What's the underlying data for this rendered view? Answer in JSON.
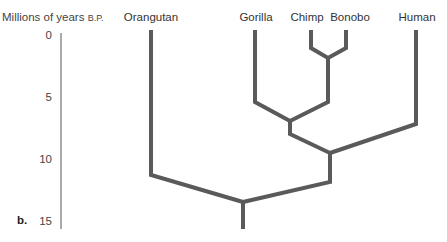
{
  "figure": {
    "panel_label": "b.",
    "axis": {
      "title": "Millions of years",
      "title_suffix": "B.P.",
      "ticks": [
        {
          "label": "0",
          "y": 36
        },
        {
          "label": "5",
          "y": 98
        },
        {
          "label": "10",
          "y": 160
        },
        {
          "label": "15",
          "y": 222
        }
      ],
      "color": "#555555"
    },
    "taxa": [
      {
        "label": "Orangutan",
        "x": 151
      },
      {
        "label": "Gorilla",
        "x": 255
      },
      {
        "label": "Chimp",
        "x": 311
      },
      {
        "label": "Bonobo",
        "x": 346
      },
      {
        "label": "Human",
        "x": 416
      }
    ],
    "branch_color": "#5a5a5a"
  }
}
